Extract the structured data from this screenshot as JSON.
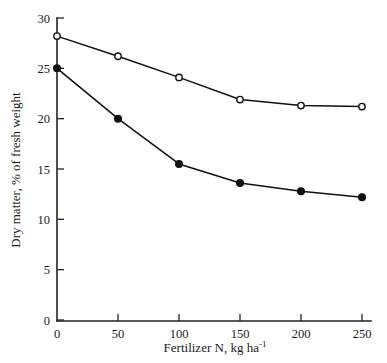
{
  "chart_data": {
    "type": "line",
    "title": "",
    "subtitle": "",
    "xlabel": "Fertilizer N, kg ha",
    "xlabel_exponent": "-1",
    "ylabel": "Dry matter, % of fresh weight",
    "x": [
      0,
      50,
      100,
      150,
      200,
      250
    ],
    "xlim": [
      0,
      250
    ],
    "ylim": [
      0,
      30
    ],
    "xticks": [
      "0",
      "50",
      "100",
      "150",
      "200",
      "250"
    ],
    "yticks": [
      "0",
      "5",
      "10",
      "15",
      "20",
      "25",
      "30"
    ],
    "xtick_values": [
      0,
      50,
      100,
      150,
      200,
      250
    ],
    "ytick_values": [
      0,
      5,
      10,
      15,
      20,
      25,
      30
    ],
    "grid": false,
    "legend": false,
    "legend_position": "none",
    "series": [
      {
        "name": "open-circle-series",
        "marker": "open-circle",
        "values": [
          28.2,
          26.2,
          24.1,
          21.9,
          21.3,
          21.2
        ]
      },
      {
        "name": "filled-circle-series",
        "marker": "filled-circle",
        "values": [
          25.0,
          20.0,
          15.5,
          13.6,
          12.8,
          12.2
        ]
      }
    ],
    "colors": {
      "line": "#111111",
      "axis": "#222222",
      "background": "#ffffff",
      "marker_fill_open": "#ffffff",
      "marker_fill_closed": "#111111"
    }
  }
}
